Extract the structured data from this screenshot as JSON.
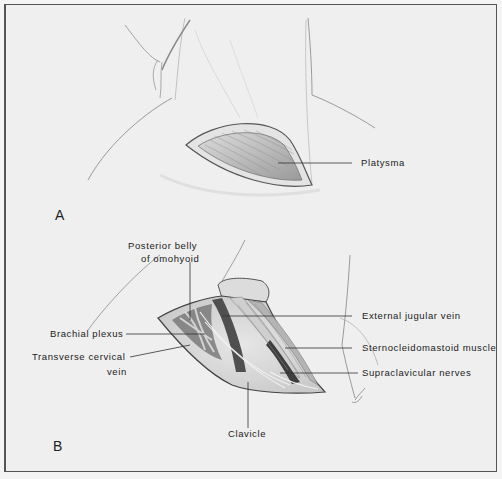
{
  "figure": {
    "panels": [
      {
        "id": "A",
        "letter": "A",
        "labels": [
          {
            "text": "Platysma"
          }
        ]
      },
      {
        "id": "B",
        "letter": "B",
        "labels": [
          {
            "text": "Posterior belly"
          },
          {
            "text": "of omohyoid"
          },
          {
            "text": "Brachial plexus"
          },
          {
            "text": "Transverse cervical"
          },
          {
            "text": "vein"
          },
          {
            "text": "External jugular vein"
          },
          {
            "text": "Sternocleidomastoid muscle"
          },
          {
            "text": "Supraclavicular nerves"
          },
          {
            "text": "Clavicle"
          }
        ]
      }
    ]
  },
  "colors": {
    "background": "#efefef",
    "frame": "#555555",
    "ink": "#222222",
    "sketch": "#8a8a8a",
    "tissue": "#d8d8d8",
    "tissue_dark": "#5a5a5a"
  }
}
